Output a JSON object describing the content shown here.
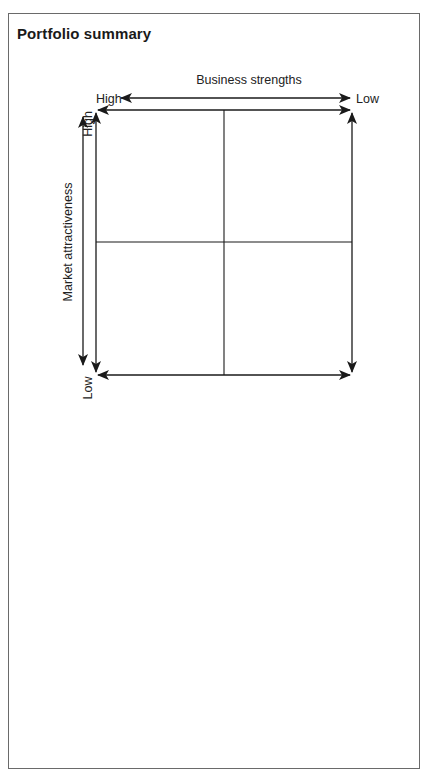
{
  "page": {
    "title": "Portfolio summary"
  },
  "diagram": {
    "type": "2x2 matrix",
    "x_axis": {
      "label": "Business strengths",
      "left_end": "High",
      "right_end": "Low"
    },
    "y_axis": {
      "label": "Market attractiveness",
      "top_end": "High",
      "bottom_end": "Low"
    },
    "quadrants": [
      {
        "position": "top-left",
        "content": ""
      },
      {
        "position": "top-right",
        "content": ""
      },
      {
        "position": "bottom-left",
        "content": ""
      },
      {
        "position": "bottom-right",
        "content": ""
      }
    ],
    "colors": {
      "line": "#1a1a1a",
      "frame": "#6a6a6a",
      "background": "#ffffff"
    }
  }
}
